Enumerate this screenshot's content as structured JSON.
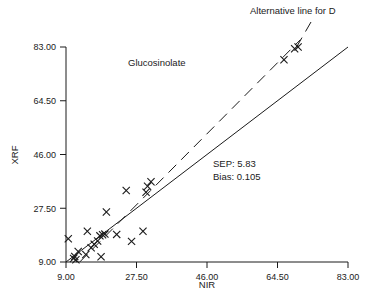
{
  "chart_data": {
    "type": "scatter",
    "title": "Glucosinolate",
    "xlabel": "NIR",
    "ylabel": "XRF",
    "xlim": [
      9.0,
      83.0
    ],
    "ylim": [
      9.0,
      83.0
    ],
    "grid": false,
    "legend": null,
    "xticks": [
      "9.00",
      "27.50",
      "46.00",
      "64.50",
      "83.00"
    ],
    "yticks": [
      "9.00",
      "27.50",
      "46.00",
      "64.50",
      "83.00"
    ],
    "xtick_values": [
      9.0,
      27.5,
      46.0,
      64.5,
      83.0
    ],
    "ytick_values": [
      9.0,
      27.5,
      46.0,
      64.5,
      83.0
    ],
    "marker": "x",
    "points": [
      {
        "x": 9.6,
        "y": 17.0
      },
      {
        "x": 11.0,
        "y": 10.2
      },
      {
        "x": 11.3,
        "y": 10.9
      },
      {
        "x": 11.6,
        "y": 9.8
      },
      {
        "x": 12.2,
        "y": 12.6
      },
      {
        "x": 14.2,
        "y": 11.6
      },
      {
        "x": 14.6,
        "y": 19.6
      },
      {
        "x": 15.6,
        "y": 13.9
      },
      {
        "x": 16.4,
        "y": 15.1
      },
      {
        "x": 17.3,
        "y": 16.2
      },
      {
        "x": 17.9,
        "y": 18.0
      },
      {
        "x": 18.6,
        "y": 18.4
      },
      {
        "x": 19.2,
        "y": 18.6
      },
      {
        "x": 18.2,
        "y": 10.8
      },
      {
        "x": 19.6,
        "y": 26.2
      },
      {
        "x": 22.3,
        "y": 18.5
      },
      {
        "x": 24.8,
        "y": 33.6
      },
      {
        "x": 26.2,
        "y": 16.1
      },
      {
        "x": 29.2,
        "y": 19.6
      },
      {
        "x": 30.0,
        "y": 33.0
      },
      {
        "x": 30.4,
        "y": 35.1
      },
      {
        "x": 31.3,
        "y": 36.6
      },
      {
        "x": 66.2,
        "y": 78.6
      },
      {
        "x": 69.0,
        "y": 82.4
      },
      {
        "x": 69.9,
        "y": 83.0
      }
    ],
    "lines": [
      {
        "name": "regression-line",
        "style": "solid",
        "x0": 9.0,
        "y0": 9.0,
        "x1": 83.0,
        "y1": 83.0
      },
      {
        "name": "alternative-line",
        "style": "dashed",
        "label": "Alternative line for D",
        "x0": 12.6,
        "y0": 9.0,
        "x1": 70.5,
        "y1": 85.5
      }
    ],
    "annotations": [
      {
        "name": "alternative-line-callout",
        "text": "Alternative line for D"
      },
      {
        "name": "sep-stat",
        "text": "SEP: 5.83"
      },
      {
        "name": "bias-stat",
        "text": "Bias: 0.105"
      },
      {
        "name": "series-title",
        "text": "Glucosinolate"
      }
    ],
    "stats": {
      "sep_label": "SEP: 5.83",
      "bias_label": "Bias: 0.105"
    },
    "colors": {
      "axis": "#1a1a1a",
      "marker": "#1a1a1a",
      "line": "#1a1a1a",
      "background": "#ffffff"
    }
  }
}
